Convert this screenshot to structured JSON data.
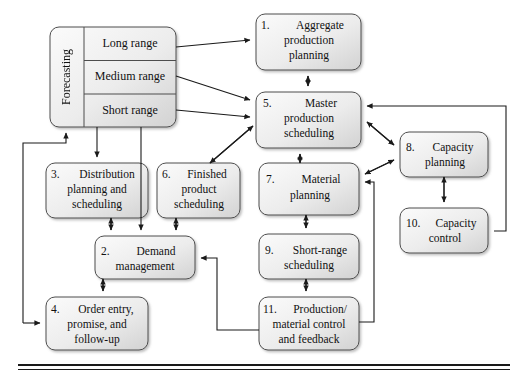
{
  "figure": {
    "bottom_rule": true
  },
  "style": {
    "box_fill_light": "#f4f4f4",
    "box_fill_dark": "#d9d9d9",
    "box_stroke": "#4d4d4d",
    "arrow_color": "#1a1a1a",
    "text_color": "#111111",
    "rule_color": "#1a1a1a",
    "background": "#ffffff"
  },
  "groups": {
    "forecasting": {
      "label": "Forecasting",
      "orientation": "vertical",
      "items": [
        {
          "label": "Long range"
        },
        {
          "label": "Medium range"
        },
        {
          "label": "Short range"
        }
      ]
    }
  },
  "nodes": [
    {
      "id": "n1",
      "number": "1.",
      "label": "Aggregate\nproduction\nplanning"
    },
    {
      "id": "n5",
      "number": "5.",
      "label": "Master\nproduction\nscheduling"
    },
    {
      "id": "n3",
      "number": "3.",
      "label": "Distribution\nplanning and\nscheduling"
    },
    {
      "id": "n6",
      "number": "6.",
      "label": "Finished\nproduct\nscheduling"
    },
    {
      "id": "n7",
      "number": "7.",
      "label": "Material\nplanning"
    },
    {
      "id": "n8",
      "number": "8.",
      "label": "Capacity\nplanning"
    },
    {
      "id": "n10",
      "number": "10.",
      "label": "Capacity\ncontrol"
    },
    {
      "id": "n2",
      "number": "2.",
      "label": "Demand\nmanagement"
    },
    {
      "id": "n9",
      "number": "9.",
      "label": "Short-range\nscheduling"
    },
    {
      "id": "n4",
      "number": "4.",
      "label": "Order entry,\npromise, and\nfollow-up"
    },
    {
      "id": "n11",
      "number": "11.",
      "label": "Production/\nmaterial control\nand feedback"
    }
  ],
  "node_text": {
    "n1_line1": "1.",
    "n1_line2": "Aggregate",
    "n1_line3": "production",
    "n1_line4": "planning",
    "n5_line1": "5.",
    "n5_line2": "Master",
    "n5_line3": "production",
    "n5_line4": "scheduling",
    "n3_line1": "3.",
    "n3_line2": "Distribution",
    "n3_line3": "planning and",
    "n3_line4": "scheduling",
    "n6_line1": "6.",
    "n6_line2": "Finished",
    "n6_line3": "product",
    "n6_line4": "scheduling",
    "n7_line1": "7.",
    "n7_line2": "Material",
    "n7_line3": "planning",
    "n8_line1": "8.",
    "n8_line2": "Capacity",
    "n8_line3": "planning",
    "n10_line1": "10.",
    "n10_line2": "Capacity",
    "n10_line3": "control",
    "n2_line1": "2.",
    "n2_line2": "Demand",
    "n2_line3": "management",
    "n9_line1": "9.",
    "n9_line2": "Short-range",
    "n9_line3": "scheduling",
    "n4_line1": "4.",
    "n4_line2": "Order entry,",
    "n4_line3": "promise, and",
    "n4_line4": "follow-up",
    "n11_line1": "11.",
    "n11_line2": "Production/",
    "n11_line3": "material control",
    "n11_line4": "and feedback",
    "fc_title": "Forecasting",
    "fc_long": "Long range",
    "fc_medium": "Medium range",
    "fc_short": "Short range"
  },
  "connections": [
    {
      "from": "forecasting.long_range",
      "to": "n1",
      "type": "single"
    },
    {
      "from": "forecasting.medium_range",
      "to": "n5",
      "type": "single"
    },
    {
      "from": "forecasting.short_range",
      "to": "n5",
      "type": "single"
    },
    {
      "from": "n1",
      "to": "n5",
      "type": "double"
    },
    {
      "from": "forecasting",
      "to": "n3",
      "type": "single"
    },
    {
      "from": "forecasting",
      "to": "n2",
      "type": "single"
    },
    {
      "from": "n3",
      "to": "n2",
      "type": "double"
    },
    {
      "from": "n6",
      "to": "n2",
      "type": "double"
    },
    {
      "from": "n5",
      "to": "n6",
      "type": "double"
    },
    {
      "from": "n2",
      "to": "n4",
      "type": "double"
    },
    {
      "from": "n4",
      "to": "forecasting",
      "type": "single"
    },
    {
      "from": "n5",
      "to": "n7",
      "type": "double"
    },
    {
      "from": "n7",
      "to": "n9",
      "type": "double"
    },
    {
      "from": "n9",
      "to": "n11",
      "type": "double"
    },
    {
      "from": "n11",
      "to": "n2",
      "type": "single"
    },
    {
      "from": "n11",
      "to": "n7",
      "type": "single"
    },
    {
      "from": "n5",
      "to": "n8",
      "type": "double"
    },
    {
      "from": "n7",
      "to": "n8",
      "type": "double"
    },
    {
      "from": "n8",
      "to": "n10",
      "type": "double"
    },
    {
      "from": "n10",
      "to": "n5",
      "type": "single"
    },
    {
      "from": "n11",
      "to": "n10",
      "type": "single"
    }
  ]
}
